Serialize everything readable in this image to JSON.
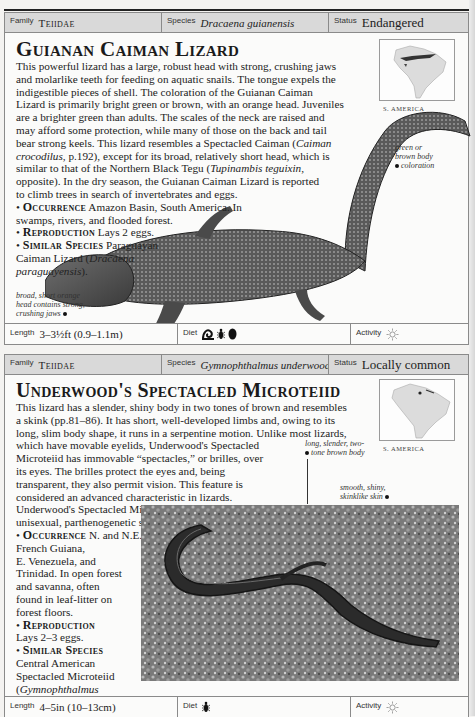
{
  "entries": [
    {
      "header": {
        "family_label": "Family",
        "family": "Teiidae",
        "species_label": "Species",
        "species": "Dracaena guianensis",
        "status_label": "Status",
        "status": "Endangered"
      },
      "title": "Guianan Caiman Lizard",
      "description_lines": [
        "This powerful lizard has a large, robust head with strong, crushing jaws",
        "and molarlike teeth for feeding on aquatic snails. The tongue expels the",
        "indigestible pieces of shell. The coloration of the Guianan Caiman",
        "Lizard is primarily bright green or brown, with an orange head. Juveniles",
        "are a brighter green than adults. The scales of the neck are raised and",
        "may afford some protection, while many of those on the back and tail",
        "bear strong keels. This lizard resembles a Spectacled Caiman (",
        "crocodilus",
        ", p.192), except for its broad, relatively short head, which is",
        "similar to that of the Northern Black Tegu (",
        "Tupinambis teguixin",
        "opposite). In the dry season, the Guianan Caiman Lizard is reported",
        "to climb trees in search of invertebrates and eggs."
      ],
      "italic_terms": {
        "caiman": "Caiman",
        "crocodilus": "crocodilus",
        "tegu": "Tupinambis teguixin,"
      },
      "occurrence": {
        "label": "Occurrence",
        "text_line1": "Amazon Basin, South America. In",
        "text_line2": "swamps, rivers, and flooded forest."
      },
      "reproduction": {
        "label": "Reproduction",
        "text": "Lays 2 eggs."
      },
      "similar": {
        "label": "Similar Species",
        "text_line1": "Paraguayan",
        "text_line2": "Caiman Lizard (",
        "italic1": "Dracaena",
        "italic2": "paraguayensis",
        "end": ")."
      },
      "map_label": "S. AMERICA",
      "captions": {
        "body": [
          "green or",
          "brown body",
          "coloration"
        ],
        "head": [
          "broad, short orange",
          "head contains strong,",
          "crushing jaws"
        ]
      },
      "footer": {
        "length_label": "Length",
        "length": "3–3½ft (0.9–1.1m)",
        "diet_label": "Diet",
        "diet_icons": [
          "snail-icon",
          "insect-icon",
          "egg-icon"
        ],
        "activity_label": "Activity",
        "activity_icon": "sun-icon"
      }
    },
    {
      "header": {
        "family_label": "Family",
        "family": "Teiidae",
        "species_label": "Species",
        "species": "Gymnophthalmus underwoodi",
        "status_label": "Status",
        "status": "Locally common"
      },
      "title": "Underwood's Spectacled Microteiid",
      "description_lines": [
        "This lizard has a slender, shiny body in two tones of brown and resembles",
        "a skink (pp.81–86). It has short, well-developed limbs and, owing to its",
        "long, slim body shape, it runs in a serpentine motion. Unlike most lizards,",
        "which have movable eyelids, Underwood's Spectacled",
        "Microteiid has immovable “spectacles,” or brilles, over",
        "its eyes. The brilles protect the eyes and, being",
        "transparent, they also permit vision. This feature is",
        "considered an advanced characteristic in lizards.",
        "Underwood's Spectacled Microteiid is an exclusively",
        "unisexual, parthenogenetic species."
      ],
      "occurrence": {
        "label": "Occurrence",
        "lines": [
          "N. and N.E. Brazil, Guyana, Surinam,",
          "French Guiana,",
          "E. Venezuela, and",
          "Trinidad. In open forest",
          "and savanna, often",
          "found in leaf-litter on",
          "forest floors."
        ]
      },
      "reproduction": {
        "label": "Reproduction",
        "text": "Lays 2–3 eggs."
      },
      "similar": {
        "label": "Similar Species",
        "lines": [
          "Central American",
          "Spectacled Microteiid"
        ],
        "italic1": "Gymnophthalmus",
        "italic2": "speciosus",
        "end": ")."
      },
      "map_label": "S. AMERICA",
      "captions": {
        "body": [
          "long, slender, two-",
          "tone brown body"
        ],
        "skin": [
          "smooth, shiny,",
          "skinklike skin"
        ]
      },
      "footer": {
        "length_label": "Length",
        "length": "4–5in (10–13cm)",
        "diet_label": "Diet",
        "diet_icons": [
          "insect-icon"
        ],
        "activity_label": "Activity",
        "activity_icon": "sun-icon"
      }
    }
  ]
}
